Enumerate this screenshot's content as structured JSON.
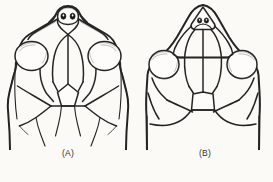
{
  "plate": {
    "kind": "scientific-line-drawing",
    "subject": "dorsal head scalation diagrams",
    "background_color": "#fbfaf7",
    "ink_color": "#262422",
    "figure_count": 2
  },
  "figures": [
    {
      "id": "A",
      "caption": "(A)",
      "view": "dorsal head",
      "snout_shape": "rounded",
      "frontal": "undivided",
      "nostril_count": 2,
      "interparietal": "pentagonal",
      "supraocular": "large circular, separated by narrow temporal strip",
      "outer_temporal_strip": "present",
      "nuchal_margin": "irregular, fading"
    },
    {
      "id": "B",
      "caption": "(B)",
      "view": "dorsal head",
      "snout_shape": "triangular / pointed",
      "frontal": "divided",
      "nostril_count": 2,
      "interparietal": "pentagonal",
      "supraocular": "large circular, set into scale network",
      "outer_temporal_strip": "absent",
      "nuchal_margin": "regular, W-shaped"
    }
  ],
  "captions": {
    "a": "(A)",
    "b": "(B)"
  },
  "cutoff_text": ""
}
